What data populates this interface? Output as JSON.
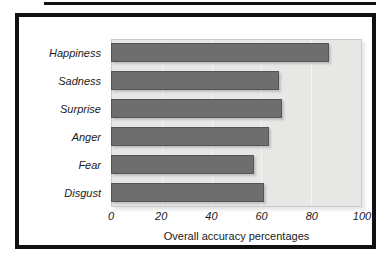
{
  "chart_data": {
    "type": "bar",
    "orientation": "horizontal",
    "title": "",
    "xlabel": "Overall accuracy percentages",
    "ylabel": "",
    "categories": [
      "Happiness",
      "Sadness",
      "Surprise",
      "Anger",
      "Fear",
      "Disgust"
    ],
    "values": [
      87,
      67,
      68,
      63,
      57,
      61
    ],
    "xlim": [
      0,
      100
    ],
    "xticks": [
      0,
      20,
      40,
      60,
      80,
      100
    ],
    "xtick_labels": [
      "0",
      "20",
      "40",
      "60",
      "80",
      "100"
    ],
    "grid": true,
    "legend": false,
    "series": [
      {
        "name": "Overall accuracy percentages",
        "values": [
          87,
          67,
          68,
          63,
          57,
          61
        ]
      }
    ]
  },
  "style": {
    "bar_color": "#6e6e6e",
    "bar_edge_color": "#555555",
    "plot_background": "#e7e7e6",
    "gridline_color": "#f4f4f3",
    "frame_color": "#111111",
    "page_background": "#ffffff",
    "text_color": "#1a1a1a"
  }
}
